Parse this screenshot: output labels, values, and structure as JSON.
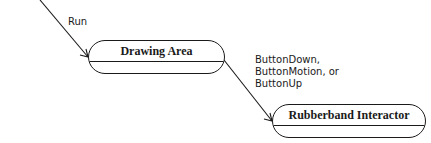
{
  "diagram": {
    "nodes": [
      {
        "id": "drawing-area",
        "label": "Drawing Area"
      },
      {
        "id": "rubberband-interactor",
        "label": "Rubberband Interactor"
      }
    ],
    "edges": [
      {
        "from": "offscreen-top",
        "to": "drawing-area",
        "label": "Run"
      },
      {
        "from": "drawing-area",
        "to": "rubberband-interactor",
        "label_lines": [
          "ButtonDown,",
          "ButtonMotion, or",
          "ButtonUp"
        ]
      }
    ],
    "colors": {
      "stroke": "#1a1a1a",
      "background": "#ffffff"
    }
  }
}
